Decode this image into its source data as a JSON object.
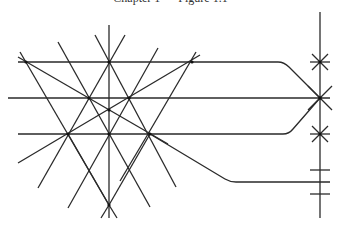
{
  "caption": "Chapter 1 — Figure 1.1",
  "diagram": {
    "stroke_color": "#2a2a2a",
    "horizontal_lines": [
      {
        "id": "top",
        "y": 62,
        "x_start": 18,
        "bend_start_x": 278,
        "end": [
          320,
          98
        ]
      },
      {
        "id": "middle",
        "y": 98,
        "x_start": 8,
        "x_end": 330
      },
      {
        "id": "bottom",
        "y": 134,
        "x_start": 18,
        "bend_start_x": 283,
        "end": [
          320,
          98
        ]
      },
      {
        "id": "lower-branch",
        "from": [
          150,
          134
        ],
        "bend": [
          230,
          182
        ],
        "x_end": 330
      }
    ],
    "vertical_lines": [
      {
        "id": "center",
        "x": 109,
        "y_start": 25,
        "y_end": 218
      },
      {
        "id": "rail",
        "x": 320,
        "y_start": 12,
        "y_end": 218
      }
    ],
    "intersection_points": [
      [
        26,
        62
      ],
      [
        109,
        62
      ],
      [
        192,
        62
      ],
      [
        89,
        98
      ],
      [
        129,
        98
      ],
      [
        109,
        110
      ],
      [
        68,
        134
      ],
      [
        109,
        134
      ],
      [
        150,
        134
      ],
      [
        109,
        205
      ]
    ],
    "rail_markers": {
      "stars": [
        62,
        98,
        134
      ],
      "ticks": [
        170,
        182,
        194
      ]
    }
  }
}
